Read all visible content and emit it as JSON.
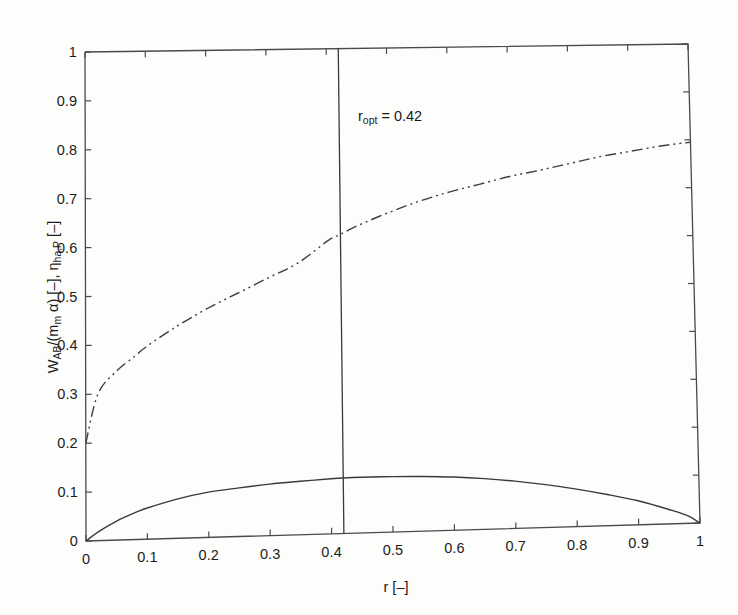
{
  "figure": {
    "background": "#fdfdfc",
    "line_color": "#3a3a3a"
  },
  "axes": {
    "x_title_main": "r",
    "x_title_unit": " [–]",
    "x_title_full": "r [–]",
    "y_title_part1": "W",
    "y_title_sub1": "AB",
    "y_title_part2": "/(m",
    "y_title_sub2": "m",
    "y_title_part3": " α) [–], η",
    "y_title_sub3": "ha,P",
    "y_title_part4": " [–]",
    "y_title_full": "W_AB/(m_m α) [–], η_ha,P [–]",
    "xticks": [
      "0",
      "0.1",
      "0.2",
      "0.3",
      "0.4",
      "0.5",
      "0.6",
      "0.7",
      "0.8",
      "0.9",
      "1"
    ],
    "yticks": [
      "0",
      "0.1",
      "0.2",
      "0.3",
      "0.4",
      "0.5",
      "0.6",
      "0.7",
      "0.8",
      "0.9",
      "1"
    ]
  },
  "annotation": {
    "label_main": "r",
    "label_sub": "opt",
    "label_rest": " = 0.42",
    "label_full": "r_opt = 0.42",
    "value": 0.42
  },
  "chart_data": {
    "type": "line",
    "title": "",
    "xlabel": "r [–]",
    "ylabel": "W_AB/(m_m α) [–], η_ha,P [–]",
    "xlim": [
      0,
      1
    ],
    "ylim": [
      0,
      1
    ],
    "xticks": [
      0,
      0.1,
      0.2,
      0.3,
      0.4,
      0.5,
      0.6,
      0.7,
      0.8,
      0.9,
      1
    ],
    "yticks": [
      0,
      0.1,
      0.2,
      0.3,
      0.4,
      0.5,
      0.6,
      0.7,
      0.8,
      0.9,
      1
    ],
    "grid": false,
    "legend": "none",
    "annotations": [
      {
        "text": "r_opt = 0.42",
        "x": 0.42,
        "y": 0.865,
        "type": "vertical-line-label"
      }
    ],
    "vertical_line": {
      "x": 0.42,
      "y_from": 0.0,
      "y_to": 1.0,
      "style": "solid"
    },
    "series": [
      {
        "name": "eta_ha,P",
        "style": "dash-dot-dot",
        "x": [
          0,
          0.02,
          0.05,
          0.08,
          0.1,
          0.15,
          0.2,
          0.25,
          0.3,
          0.35,
          0.4,
          0.42,
          0.45,
          0.5,
          0.55,
          0.6,
          0.65,
          0.7,
          0.75,
          0.8,
          0.85,
          0.9,
          0.95,
          1
        ],
        "values": [
          0.2,
          0.3,
          0.345,
          0.375,
          0.395,
          0.435,
          0.47,
          0.5,
          0.53,
          0.56,
          0.605,
          0.617,
          0.635,
          0.66,
          0.682,
          0.7,
          0.715,
          0.73,
          0.742,
          0.755,
          0.768,
          0.778,
          0.788,
          0.795
        ]
      },
      {
        "name": "W_AB/(m_m alpha)",
        "style": "solid",
        "x": [
          0,
          0.02,
          0.05,
          0.08,
          0.1,
          0.15,
          0.2,
          0.25,
          0.3,
          0.35,
          0.4,
          0.42,
          0.45,
          0.5,
          0.55,
          0.6,
          0.65,
          0.7,
          0.75,
          0.8,
          0.85,
          0.9,
          0.95,
          0.98,
          1
        ],
        "values": [
          0.0,
          0.018,
          0.039,
          0.055,
          0.064,
          0.081,
          0.093,
          0.1,
          0.106,
          0.11,
          0.1135,
          0.1145,
          0.115,
          0.1145,
          0.113,
          0.11,
          0.105,
          0.098,
          0.089,
          0.078,
          0.065,
          0.05,
          0.03,
          0.016,
          0.0
        ]
      }
    ]
  }
}
